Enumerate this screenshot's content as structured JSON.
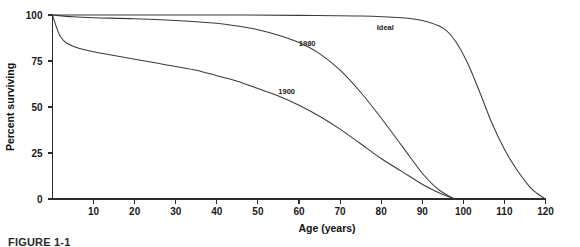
{
  "figure": {
    "caption": "FIGURE 1-1"
  },
  "chart_data": {
    "type": "line",
    "title": "",
    "xlabel": "Age (years)",
    "ylabel": "Percent surviving",
    "xlim": [
      0,
      120
    ],
    "ylim": [
      0,
      100
    ],
    "grid": false,
    "legend_position": "inline-annotations",
    "xticks": [
      10,
      20,
      30,
      40,
      50,
      60,
      70,
      80,
      90,
      100,
      110,
      120
    ],
    "xtick_labels": [
      "10",
      "20",
      "30",
      "40",
      "50",
      "60",
      "70",
      "80",
      "90",
      "100",
      "110",
      "120"
    ],
    "yticks": [
      0,
      25,
      50,
      75,
      100
    ],
    "ytick_labels": [
      "0",
      "25",
      "50",
      "75",
      "100"
    ],
    "series": [
      {
        "name": "1900",
        "label": "1900",
        "label_x": 57,
        "label_y": 57,
        "x": [
          0,
          2,
          5,
          10,
          15,
          20,
          25,
          30,
          35,
          40,
          45,
          50,
          55,
          60,
          65,
          70,
          75,
          80,
          85,
          90,
          93,
          95,
          97,
          98
        ],
        "values": [
          100,
          88,
          83,
          80,
          78,
          76,
          74,
          72,
          70,
          67,
          64,
          60,
          56,
          51,
          45,
          38,
          30,
          22,
          15,
          8,
          4.5,
          2.5,
          0.8,
          0
        ]
      },
      {
        "name": "1980",
        "label": "1980",
        "label_x": 62,
        "label_y": 83,
        "x": [
          0,
          5,
          10,
          20,
          30,
          40,
          45,
          50,
          55,
          60,
          65,
          70,
          75,
          80,
          85,
          90,
          93,
          95,
          97,
          98
        ],
        "values": [
          100,
          99,
          98.5,
          98,
          97,
          95.5,
          94,
          92,
          89,
          85,
          79,
          70,
          58,
          44,
          29,
          14,
          7,
          3.5,
          1,
          0
        ]
      },
      {
        "name": "Ideal",
        "label": "Ideal",
        "label_x": 81,
        "label_y": 92,
        "x": [
          0,
          20,
          40,
          60,
          75,
          85,
          90,
          95,
          98,
          101,
          104,
          107,
          110,
          113,
          116,
          118,
          120
        ],
        "values": [
          100,
          100,
          100,
          99.8,
          99.5,
          98.5,
          97,
          93,
          86,
          74,
          58,
          41,
          27,
          16,
          7,
          3,
          0
        ]
      }
    ]
  }
}
